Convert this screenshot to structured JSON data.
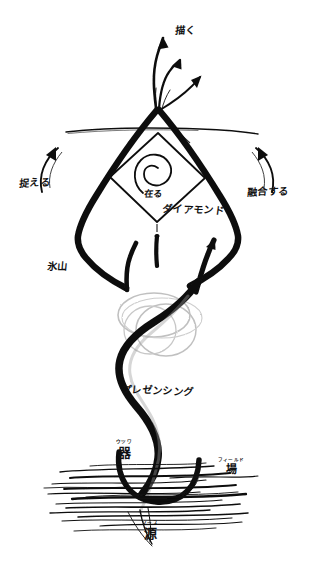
{
  "canvas": {
    "width": 314,
    "height": 575,
    "background": "#ffffff",
    "ink": "#111111",
    "ink_soft": "#8d8d8d"
  },
  "diagram": {
    "title": "プレゼンシング",
    "type": "hand-drawn-sketch"
  },
  "labels": {
    "draw": "描く",
    "grasp": "捉える",
    "fuse": "融合する",
    "be": "在る",
    "diamond": "ダイアモンド",
    "iceberg": "氷山",
    "presencing": "プレゼンシング"
  },
  "ruby_labels": [
    {
      "name": "vessel",
      "reading": "ウツワ",
      "base": "器"
    },
    {
      "name": "field",
      "reading": "フィールド",
      "base": "場"
    },
    {
      "name": "source",
      "reading": "ソース",
      "base": "源"
    }
  ]
}
